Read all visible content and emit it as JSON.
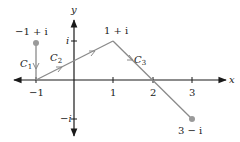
{
  "axes": {
    "x_label": "x",
    "y_label": "y",
    "x_ticks": [
      "−1",
      "1",
      "2",
      "3"
    ],
    "y_ticks": [
      "i",
      "−i"
    ]
  },
  "points": {
    "start": "−1 + i",
    "peak": "1 + i",
    "end": "3 − i"
  },
  "curves": {
    "c1": "C",
    "c1_sub": "1",
    "c2": "C",
    "c2_sub": "2",
    "c3": "C",
    "c3_sub": "3"
  },
  "colors": {
    "path": "#8a8a8a",
    "axis": "#1a1a1a",
    "point": "#9a9a9a"
  }
}
